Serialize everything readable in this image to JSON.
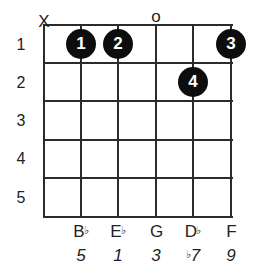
{
  "chord_diagram": {
    "instrument": "guitar",
    "strings_count": 6,
    "frets_shown": 5,
    "fret_numbers": [
      "1",
      "2",
      "3",
      "4",
      "5"
    ],
    "string_markers": [
      {
        "string": 1,
        "marker": "X",
        "meaning": "muted"
      },
      {
        "string": 4,
        "marker": "o",
        "meaning": "open"
      }
    ],
    "fingerings": [
      {
        "string": 2,
        "fret": 1,
        "finger": "1"
      },
      {
        "string": 3,
        "fret": 1,
        "finger": "2"
      },
      {
        "string": 6,
        "fret": 1,
        "finger": "3"
      },
      {
        "string": 5,
        "fret": 2,
        "finger": "4"
      }
    ],
    "notes": [
      {
        "string": 2,
        "name": "B",
        "accidental": "♭",
        "interval_prefix": "",
        "interval": "5"
      },
      {
        "string": 3,
        "name": "E",
        "accidental": "♭",
        "interval_prefix": "",
        "interval": "1"
      },
      {
        "string": 4,
        "name": "G",
        "accidental": "",
        "interval_prefix": "",
        "interval": "3"
      },
      {
        "string": 5,
        "name": "D",
        "accidental": "♭",
        "interval_prefix": "♭",
        "interval": "7"
      },
      {
        "string": 6,
        "name": "F",
        "accidental": "",
        "interval_prefix": "",
        "interval": "9"
      }
    ],
    "colors": {
      "grid": "#2b2b2b",
      "dot": "#0d0d0d",
      "dot_text": "#ffffff",
      "text": "#222222"
    }
  }
}
